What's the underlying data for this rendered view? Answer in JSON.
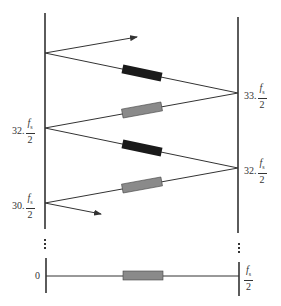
{
  "diagram": {
    "type": "frequency-folding-zigzag",
    "colors": {
      "line": "#333333",
      "filter_dark": "#1a1a1a",
      "filter_gray": "#8a8a8a"
    },
    "left_labels": [
      {
        "coef": "32.",
        "num": "f",
        "sub": "s",
        "den": "2"
      },
      {
        "coef": "30.",
        "num": "f",
        "sub": "s",
        "den": "2"
      },
      {
        "coef": "0"
      }
    ],
    "right_labels": [
      {
        "coef": "33.",
        "num": "f",
        "sub": "s",
        "den": "2"
      },
      {
        "coef": "32.",
        "num": "f",
        "sub": "s",
        "den": "2"
      },
      {
        "coef": "",
        "num": "f",
        "sub": "s",
        "den": "2"
      }
    ],
    "ellipsis": "⋮"
  }
}
